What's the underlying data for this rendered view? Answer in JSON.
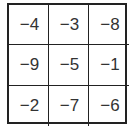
{
  "grid": {
    "rows": [
      [
        "−4",
        "−3",
        "−8"
      ],
      [
        "−9",
        "−5",
        "−1"
      ],
      [
        "−2",
        "−7",
        "−6"
      ]
    ]
  }
}
